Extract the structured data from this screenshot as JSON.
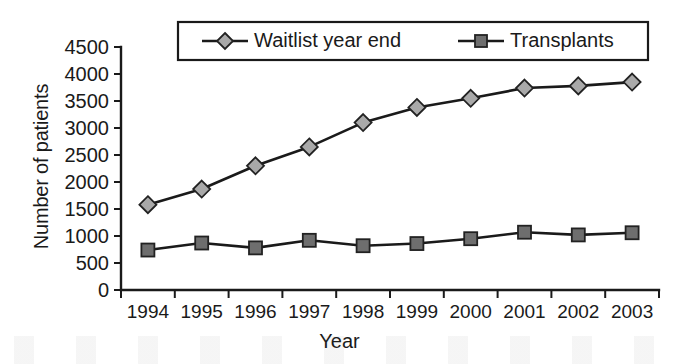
{
  "chart_data": {
    "type": "line",
    "title": "",
    "xlabel": "Year",
    "ylabel": "Number of patients",
    "categories": [
      "1994",
      "1995",
      "1996",
      "1997",
      "1998",
      "1999",
      "2000",
      "2001",
      "2002",
      "2003"
    ],
    "ylim": [
      0,
      4500
    ],
    "ytick_step": 500,
    "yticks": [
      "0",
      "500",
      "1000",
      "1500",
      "2000",
      "2500",
      "3000",
      "3500",
      "4000",
      "4500"
    ],
    "grid": false,
    "legend_position": "top-center",
    "series": [
      {
        "name": "Waitlist year end",
        "marker": "diamond",
        "marker_color": "#a9a9a9",
        "line_color": "#1a1a1a",
        "values": [
          1580,
          1870,
          2300,
          2650,
          3100,
          3380,
          3550,
          3740,
          3780,
          3850
        ]
      },
      {
        "name": "Transplants",
        "marker": "square",
        "marker_color": "#6e6e6e",
        "line_color": "#1a1a1a",
        "values": [
          740,
          870,
          780,
          920,
          820,
          860,
          950,
          1070,
          1020,
          1060
        ]
      }
    ]
  },
  "colors": {
    "background": "#ffffff",
    "axis": "#1a1a1a",
    "text": "#1a1a1a",
    "waitlist_marker": "#a9a9a9",
    "transplants_marker": "#6e6e6e"
  }
}
